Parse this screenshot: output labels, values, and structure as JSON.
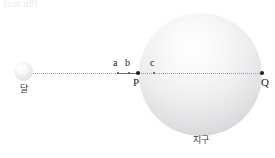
{
  "figure": {
    "type": "physics-diagram",
    "top_cutoff_text": "[cut off]",
    "bodies": [
      {
        "id": "moon",
        "label": "달",
        "label_meaning": "Moon"
      },
      {
        "id": "earth",
        "label": "지구",
        "label_meaning": "Earth"
      }
    ],
    "points": [
      {
        "id": "a",
        "label": "a",
        "position": "above-line"
      },
      {
        "id": "b",
        "label": "b",
        "position": "above-line"
      },
      {
        "id": "c",
        "label": "c",
        "position": "above-line"
      },
      {
        "id": "P",
        "label": "P",
        "position": "below-line"
      },
      {
        "id": "Q",
        "label": "Q",
        "position": "below-line"
      }
    ],
    "colors": {
      "line": "#9a9aa2",
      "solid_segment": "#6e6e76",
      "marker": "#1d1d20",
      "text": "#1d1d20",
      "label_text": "#3a3a3e",
      "background": "#ffffff"
    }
  }
}
